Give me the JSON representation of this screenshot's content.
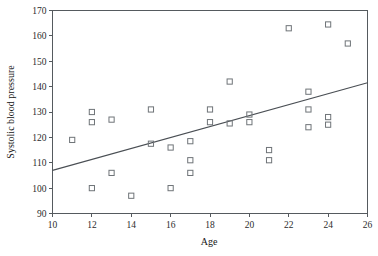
{
  "chart_data": {
    "type": "scatter",
    "title": "",
    "xlabel": "Age",
    "ylabel": "Systolic blood pressure",
    "xlim": [
      10,
      26
    ],
    "ylim": [
      90,
      170
    ],
    "xticks": [
      10,
      12,
      14,
      16,
      18,
      20,
      22,
      24,
      26
    ],
    "yticks": [
      90,
      100,
      110,
      120,
      130,
      140,
      150,
      160,
      170
    ],
    "grid": false,
    "legend": "none",
    "marker_style": "open-square",
    "marker_color": "#6f7478",
    "points": [
      {
        "x": 11,
        "y": 119
      },
      {
        "x": 12,
        "y": 130
      },
      {
        "x": 12,
        "y": 126
      },
      {
        "x": 12,
        "y": 100
      },
      {
        "x": 13,
        "y": 127
      },
      {
        "x": 13,
        "y": 106
      },
      {
        "x": 14,
        "y": 97
      },
      {
        "x": 15,
        "y": 131
      },
      {
        "x": 15,
        "y": 117.5
      },
      {
        "x": 16,
        "y": 116
      },
      {
        "x": 16,
        "y": 100
      },
      {
        "x": 17,
        "y": 118.5
      },
      {
        "x": 17,
        "y": 111
      },
      {
        "x": 17,
        "y": 106
      },
      {
        "x": 18,
        "y": 131
      },
      {
        "x": 18,
        "y": 126
      },
      {
        "x": 19,
        "y": 142
      },
      {
        "x": 19,
        "y": 125.5
      },
      {
        "x": 20,
        "y": 129
      },
      {
        "x": 20,
        "y": 126
      },
      {
        "x": 21,
        "y": 115
      },
      {
        "x": 21,
        "y": 111
      },
      {
        "x": 22,
        "y": 163
      },
      {
        "x": 23,
        "y": 138
      },
      {
        "x": 23,
        "y": 131
      },
      {
        "x": 23,
        "y": 124
      },
      {
        "x": 24,
        "y": 164.5
      },
      {
        "x": 24,
        "y": 128
      },
      {
        "x": 24,
        "y": 125
      },
      {
        "x": 25,
        "y": 157
      }
    ],
    "fit_line": {
      "type": "linear-regression",
      "color": "#4a4f54",
      "x_start": 10,
      "y_start": 107,
      "x_end": 26,
      "y_end": 141.5
    }
  }
}
